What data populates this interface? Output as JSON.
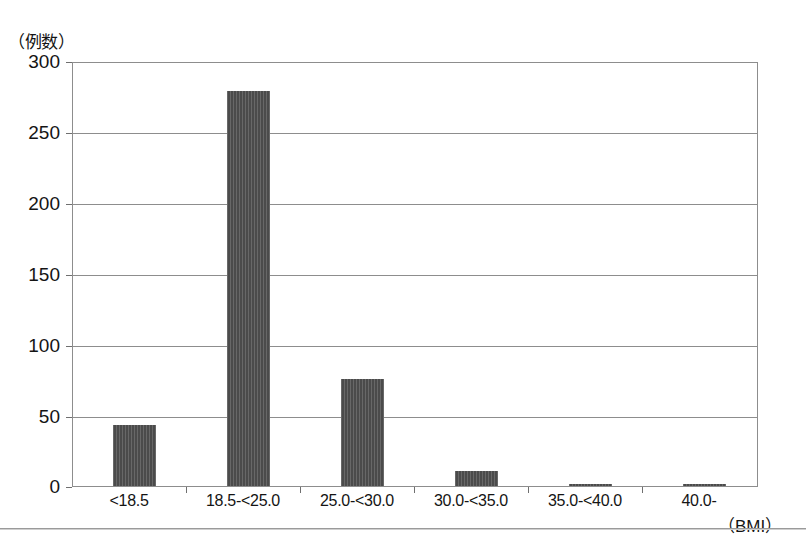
{
  "chart_data": {
    "type": "bar",
    "title": "",
    "subtitle": "",
    "xlabel": "（BMI）",
    "ylabel": "（例数）",
    "categories": [
      "<18.5",
      "18.5-<25.0",
      "25.0-<30.0",
      "30.0-<35.0",
      "35.0-<40.0",
      "40.0-"
    ],
    "values": [
      43,
      280,
      76,
      11,
      1,
      1
    ],
    "ylim": [
      0,
      300
    ],
    "yticks": [
      0,
      50,
      100,
      150,
      200,
      250,
      300
    ],
    "ytick_labels": [
      "0",
      "50",
      "100",
      "150",
      "200",
      "250",
      "300"
    ],
    "grid": true,
    "legend": false,
    "legend_position": "none",
    "bar_color": "#4b4b4b",
    "axis_color": "#8d8d8d",
    "series": [
      {
        "name": "例数",
        "values": [
          43,
          280,
          76,
          11,
          1,
          1
        ]
      }
    ]
  },
  "axes": {
    "y_unit_caption": "（例数）",
    "x_unit_caption": "（BMI）"
  }
}
